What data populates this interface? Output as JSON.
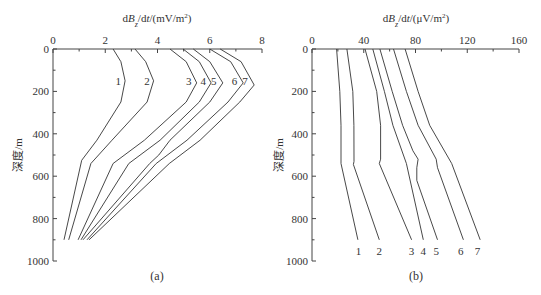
{
  "figure": {
    "panels": [
      {
        "caption": "(a)",
        "xlabel": "dB_z/dt/(mV/m²)",
        "xlabel_parts": [
          "d",
          "B",
          "z",
          "/d",
          "t",
          "/(mV/m",
          "2",
          ")"
        ],
        "ylabel": "深度/m"
      },
      {
        "caption": "(b)",
        "xlabel": "dB_z/dt/(μV/m²)",
        "xlabel_parts": [
          "d",
          "B",
          "z",
          "/d",
          "t",
          "/(μV/m",
          "2",
          ")"
        ],
        "ylabel": "深度/m"
      }
    ]
  },
  "chart_data": [
    {
      "type": "line",
      "title": "(a)",
      "xlabel": "dBz/dt/(mV/m²)",
      "ylabel": "深度/m",
      "xlim": [
        0,
        8
      ],
      "ylim": [
        1000,
        0
      ],
      "x_axis_position": "top",
      "y_inverted": true,
      "xticks": [
        0,
        2,
        4,
        6,
        8
      ],
      "yticks": [
        0,
        200,
        400,
        600,
        800,
        1000
      ],
      "grid": false,
      "legend": "inline curve labels 1-7 near depth 150 m",
      "series": [
        {
          "name": "1",
          "depth": [
            0,
            60,
            150,
            250,
            430,
            525,
            900
          ],
          "values": [
            2.3,
            2.6,
            2.76,
            2.6,
            1.68,
            1.1,
            0.42
          ]
        },
        {
          "name": "2",
          "depth": [
            0,
            60,
            150,
            250,
            430,
            540,
            900
          ],
          "values": [
            3.14,
            3.55,
            3.85,
            3.6,
            2.26,
            1.45,
            0.6
          ]
        },
        {
          "name": "3",
          "depth": [
            0,
            60,
            160,
            250,
            430,
            540,
            900
          ],
          "values": [
            4.48,
            5.1,
            5.5,
            5.1,
            3.5,
            2.3,
            0.96
          ]
        },
        {
          "name": "4",
          "depth": [
            0,
            60,
            160,
            250,
            430,
            540,
            900
          ],
          "values": [
            4.98,
            5.6,
            6.05,
            5.6,
            4.1,
            2.9,
            1.07
          ]
        },
        {
          "name": "5",
          "depth": [
            0,
            60,
            160,
            250,
            430,
            500,
            540,
            900
          ],
          "values": [
            5.37,
            6.0,
            6.5,
            6.0,
            4.48,
            4.05,
            3.7,
            1.15
          ]
        },
        {
          "name": "6",
          "depth": [
            0,
            60,
            160,
            250,
            430,
            540,
            900
          ],
          "values": [
            6.0,
            6.8,
            7.28,
            6.7,
            5.13,
            3.95,
            1.3
          ]
        },
        {
          "name": "7",
          "depth": [
            0,
            60,
            170,
            250,
            430,
            540,
            900
          ],
          "values": [
            6.4,
            7.2,
            7.7,
            7.15,
            5.63,
            4.45,
            1.38
          ]
        }
      ],
      "label_positions": {
        "1": [
          2.5,
          150
        ],
        "2": [
          3.6,
          150
        ],
        "3": [
          5.2,
          150
        ],
        "4": [
          5.75,
          150
        ],
        "5": [
          6.15,
          150
        ],
        "6": [
          6.95,
          150
        ],
        "7": [
          7.35,
          150
        ]
      }
    },
    {
      "type": "line",
      "title": "(b)",
      "xlabel": "dBz/dt/(μV/m²)",
      "ylabel": "深度/m",
      "xlim": [
        0,
        160
      ],
      "ylim": [
        1000,
        0
      ],
      "x_axis_position": "top",
      "y_inverted": true,
      "xticks": [
        0,
        40,
        80,
        120,
        160
      ],
      "yticks": [
        0,
        200,
        400,
        600,
        800,
        1000
      ],
      "grid": false,
      "legend": "inline curve labels 1-7 below curve ends near depth 950 m",
      "series": [
        {
          "name": "1",
          "depth": [
            0,
            200,
            360,
            540,
            900
          ],
          "values": [
            19,
            21.5,
            22.4,
            22.4,
            35.5
          ]
        },
        {
          "name": "2",
          "depth": [
            0,
            200,
            360,
            530,
            545,
            900
          ],
          "values": [
            27,
            31.5,
            32.4,
            32.5,
            32,
            52
          ]
        },
        {
          "name": "3",
          "depth": [
            0,
            200,
            360,
            520,
            540,
            900
          ],
          "values": [
            41,
            50,
            53,
            53,
            52,
            77
          ]
        },
        {
          "name": "4",
          "depth": [
            0,
            200,
            360,
            540,
            900
          ],
          "values": [
            47,
            56,
            62.5,
            73,
            86
          ]
        },
        {
          "name": "5",
          "depth": [
            0,
            200,
            360,
            480,
            520,
            560,
            620,
            900
          ],
          "values": [
            52.5,
            62,
            70,
            78,
            82,
            81,
            81,
            97
          ]
        },
        {
          "name": "6",
          "depth": [
            0,
            200,
            360,
            520,
            560,
            900
          ],
          "values": [
            63,
            73,
            82,
            96,
            97,
            117
          ]
        },
        {
          "name": "7",
          "depth": [
            0,
            200,
            360,
            540,
            900
          ],
          "values": [
            72,
            82,
            91,
            108,
            130
          ]
        }
      ],
      "label_positions": {
        "1": [
          36,
          955
        ],
        "2": [
          52,
          955
        ],
        "3": [
          77,
          955
        ],
        "4": [
          86,
          955
        ],
        "5": [
          96,
          955
        ],
        "6": [
          115,
          955
        ],
        "7": [
          128,
          955
        ]
      }
    }
  ]
}
